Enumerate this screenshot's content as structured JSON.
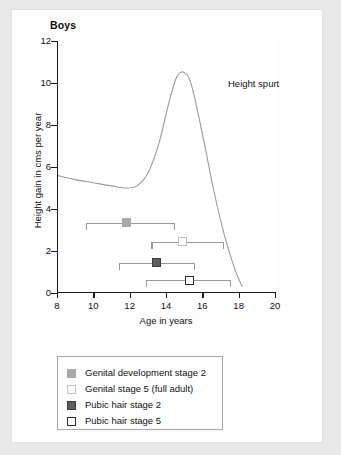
{
  "panel": {
    "title": "Boys"
  },
  "chart_data": {
    "type": "line",
    "title": "Boys",
    "xlabel": "Age in years",
    "ylabel": "Height gain in cms per year",
    "xlim": [
      8,
      20
    ],
    "ylim": [
      0,
      12
    ],
    "xticks": [
      8,
      10,
      12,
      14,
      16,
      18,
      20
    ],
    "yticks": [
      0,
      2,
      4,
      6,
      8,
      10,
      12
    ],
    "grid": false,
    "legend_position": "below-plot",
    "annotations": [
      {
        "text": "Height spurt",
        "x": 15.3,
        "y": 9.6
      }
    ],
    "series": [
      {
        "name": "Height velocity curve",
        "type": "line",
        "color": "#9a9a9a",
        "x": [
          8.0,
          9.0,
          10.0,
          11.0,
          11.8,
          12.4,
          13.0,
          13.6,
          14.2,
          14.6,
          15.0,
          15.4,
          16.0,
          16.6,
          17.2,
          17.8,
          18.2
        ],
        "y": [
          5.6,
          5.4,
          5.25,
          5.1,
          5.0,
          5.1,
          5.7,
          7.1,
          9.2,
          10.3,
          10.5,
          9.9,
          7.6,
          5.0,
          2.8,
          1.1,
          0.3
        ]
      }
    ],
    "range_bars": [
      {
        "name": "Genital development stage 2",
        "marker_style": "gd2",
        "y": 3.35,
        "range_start": 9.6,
        "range_end": 14.5,
        "mean": 11.8
      },
      {
        "name": "Genital stage 5 (full adult)",
        "marker_style": "gd5",
        "y": 2.45,
        "range_start": 13.2,
        "range_end": 17.2,
        "mean": 14.9
      },
      {
        "name": "Pubic hair stage 2",
        "marker_style": "ph2",
        "y": 1.45,
        "range_start": 11.4,
        "range_end": 15.6,
        "mean": 13.5
      },
      {
        "name": "Pubic hair stage 5",
        "marker_style": "ph5",
        "y": 0.6,
        "range_start": 12.9,
        "range_end": 17.6,
        "mean": 15.3
      }
    ]
  },
  "legend": {
    "items": [
      {
        "label": "Genital development stage 2",
        "style": "gd2"
      },
      {
        "label": "Genital stage 5 (full adult)",
        "style": "gd5"
      },
      {
        "label": "Pubic hair stage 2",
        "style": "ph2"
      },
      {
        "label": "Pubic hair stage 5",
        "style": "ph5"
      }
    ]
  },
  "colors": {
    "curve": "#9a9a9a",
    "axis": "#1a1a1a",
    "range_bar": "#9a9a9a",
    "panel_bg": "#ffffff",
    "page_bg": "#e8e8e8"
  }
}
